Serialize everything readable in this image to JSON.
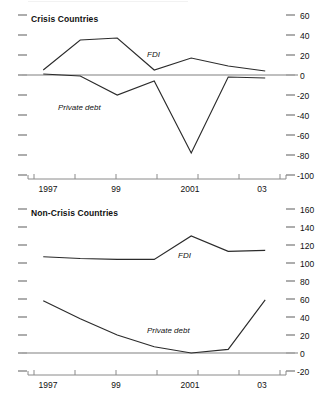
{
  "figure": {
    "background": "#ffffff",
    "line_color": "#2b2b2b",
    "zero_line_color": "#aaaaaa",
    "tick_color": "#8a8a8a",
    "axis_color": "#8a8a8a"
  },
  "chart_data": [
    {
      "type": "line",
      "title": "Crisis Countries",
      "xlabel": "",
      "ylabel": "",
      "x": [
        1997,
        1998,
        1999,
        2000,
        2001,
        2002,
        2003
      ],
      "xtick_positions": [
        1997,
        1998,
        1999,
        2000,
        2001,
        2002,
        2003
      ],
      "xticklabels": [
        "1997",
        "",
        "99",
        "",
        "2001",
        "",
        "03"
      ],
      "xlim": [
        1996.75,
        2003.4
      ],
      "ylim": [
        -100,
        60
      ],
      "yticks": [
        60,
        40,
        20,
        0,
        -20,
        -40,
        -60,
        -80,
        -100
      ],
      "yticklabels": [
        "60",
        "40",
        "20",
        "0",
        "-20",
        "-40",
        "-60",
        "-80",
        "-100"
      ],
      "grid": false,
      "zero_line": 0,
      "legend": "inline-annotations",
      "series": [
        {
          "name": "FDI",
          "label_position": {
            "x": 2000.0,
            "y": 24
          },
          "values": [
            5,
            35,
            37,
            5,
            17,
            9,
            4
          ]
        },
        {
          "name": "Private debt",
          "label_position": {
            "x": 1998.35,
            "y": -27
          },
          "values": [
            1,
            -1,
            -20,
            -6,
            -78,
            -2,
            -3
          ]
        }
      ]
    },
    {
      "type": "line",
      "title": "Non-Crisis Countries",
      "xlabel": "",
      "ylabel": "",
      "x": [
        1997,
        1998,
        1999,
        2000,
        2001,
        2002,
        2003
      ],
      "xtick_positions": [
        1997,
        1998,
        1999,
        2000,
        2001,
        2002,
        2003
      ],
      "xticklabels": [
        "1997",
        "",
        "99",
        "",
        "2001",
        "",
        "03"
      ],
      "xlim": [
        1996.75,
        2003.4
      ],
      "ylim": [
        -20,
        160
      ],
      "yticks": [
        160,
        140,
        120,
        100,
        80,
        60,
        40,
        20,
        0,
        -20
      ],
      "yticklabels": [
        "160",
        "140",
        "120",
        "100",
        "80",
        "60",
        "40",
        "20",
        "0",
        "-20"
      ],
      "grid": false,
      "zero_line": 0,
      "legend": "inline-annotations",
      "series": [
        {
          "name": "FDI",
          "label_position": {
            "x": 2000.55,
            "y": 112
          },
          "values": [
            107,
            105,
            104,
            104,
            130,
            113,
            114
          ]
        },
        {
          "name": "Private debt",
          "label_position": {
            "x": 2000.1,
            "y": 22
          },
          "values": [
            58,
            38,
            20,
            7,
            0,
            4,
            59
          ]
        }
      ]
    }
  ],
  "panels": {
    "crisis": {
      "title": "Crisis Countries",
      "yticklabels": [
        "60",
        "40",
        "20",
        "0",
        "-20",
        "-40",
        "-60",
        "-80",
        "-100"
      ],
      "xticklabels": [
        "1997",
        "99",
        "2001",
        "03"
      ],
      "series_labels": {
        "fdi": "FDI",
        "private_debt": "Private debt"
      }
    },
    "noncrisis": {
      "title": "Non-Crisis Countries",
      "yticklabels": [
        "160",
        "140",
        "120",
        "100",
        "80",
        "60",
        "40",
        "20",
        "0",
        "-20"
      ],
      "xticklabels": [
        "1997",
        "99",
        "2001",
        "03"
      ],
      "series_labels": {
        "fdi": "FDI",
        "private_debt": "Private debt"
      }
    }
  }
}
